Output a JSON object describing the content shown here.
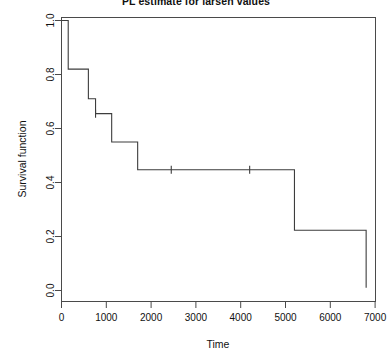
{
  "chart_data": {
    "type": "line",
    "title": "PL estimate for larsen values",
    "xlabel": "Time",
    "ylabel": "Survival function",
    "xlim": [
      0,
      7000
    ],
    "ylim": [
      0.0,
      1.0
    ],
    "grid": false,
    "legend": null,
    "x_ticks": [
      0,
      1000,
      2000,
      3000,
      4000,
      5000,
      6000,
      7000
    ],
    "x_tick_labels": [
      "0",
      "1000",
      "2000",
      "3000",
      "4000",
      "5000",
      "6000",
      "7000"
    ],
    "y_ticks": [
      0.0,
      0.2,
      0.4,
      0.6,
      0.8,
      1.0
    ],
    "y_tick_labels": [
      "0.0",
      "0.2",
      "0.4",
      "0.6",
      "0.8",
      "1.0"
    ],
    "series": [
      {
        "name": "Kaplan-Meier survival estimate",
        "style": "step-post",
        "color": "#3d3d3d",
        "x": [
          0,
          150,
          150,
          600,
          600,
          760,
          760,
          1120,
          1120,
          1700,
          1700,
          5200,
          5200,
          6800,
          6800
        ],
        "y": [
          1.0,
          1.0,
          0.82,
          0.82,
          0.71,
          0.71,
          0.655,
          0.655,
          0.55,
          0.55,
          0.447,
          0.447,
          0.223,
          0.223,
          0.01
        ]
      }
    ],
    "censored_points": {
      "name": "censored observations",
      "marker": "vertical-tick",
      "x": [
        760,
        2450,
        4200
      ],
      "y": [
        0.655,
        0.447,
        0.447
      ]
    },
    "steps": [
      {
        "time": 0,
        "survival": 1.0
      },
      {
        "time": 150,
        "survival": 0.82
      },
      {
        "time": 600,
        "survival": 0.71
      },
      {
        "time": 760,
        "survival": 0.655
      },
      {
        "time": 1120,
        "survival": 0.55
      },
      {
        "time": 1700,
        "survival": 0.447
      },
      {
        "time": 5200,
        "survival": 0.223
      },
      {
        "time": 6800,
        "survival": 0.01
      }
    ]
  }
}
